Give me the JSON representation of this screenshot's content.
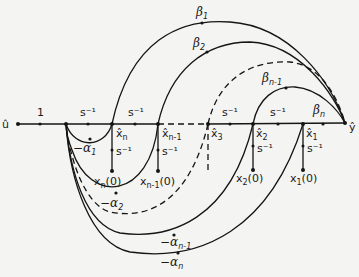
{
  "diagram": {
    "type": "signal-flow-graph",
    "input_label": "û",
    "output_label": "ŷ",
    "forward_gains": {
      "input_gain": "1",
      "integrators": [
        "s⁻¹",
        "s⁻¹",
        "s⁻¹",
        "s⁻¹"
      ]
    },
    "state_nodes": [
      {
        "label": "x̂",
        "sub": "n"
      },
      {
        "label": "x̂",
        "sub": "n-1"
      },
      {
        "label": "x̂",
        "sub": "3"
      },
      {
        "label": "x̂",
        "sub": "2"
      },
      {
        "label": "x̂",
        "sub": "1"
      }
    ],
    "initial_conditions": [
      {
        "label": "x",
        "sub": "n",
        "suffix": "(0)",
        "gain": "s⁻¹"
      },
      {
        "label": "x",
        "sub": "n-1",
        "suffix": "(0)",
        "gain": "s⁻¹"
      },
      {
        "label": "x",
        "sub": "2",
        "suffix": "(0)",
        "gain": "s⁻¹"
      },
      {
        "label": "x",
        "sub": "1",
        "suffix": "(0)",
        "gain": "s⁻¹"
      }
    ],
    "feedforward_gains": [
      {
        "sym": "β",
        "sub": "1"
      },
      {
        "sym": "β",
        "sub": "2"
      },
      {
        "sym": "β",
        "sub": "n-1"
      },
      {
        "sym": "β",
        "sub": "n"
      }
    ],
    "feedback_gains": [
      {
        "sym": "−α",
        "sub": "1"
      },
      {
        "sym": "−α",
        "sub": "2"
      },
      {
        "sym": "−α",
        "sub": "n-1"
      },
      {
        "sym": "−α",
        "sub": "n"
      }
    ]
  }
}
